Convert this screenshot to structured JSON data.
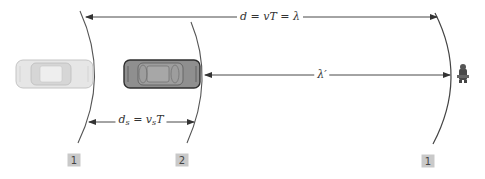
{
  "figure": {
    "labels": {
      "top_distance": "d = vT = λ",
      "wavelength_observed": "λ′",
      "source_distance_prefix": "d",
      "source_distance_sub": "s",
      "source_distance_eq": " = v",
      "source_distance_sub2": "s",
      "source_distance_suffix": "T"
    },
    "wavefronts": [
      {
        "id": "wavefront-1-left",
        "marker": "1"
      },
      {
        "id": "wavefront-2",
        "marker": "2"
      },
      {
        "id": "wavefront-1-right",
        "marker": "1"
      }
    ],
    "objects": {
      "source_position_1": "car (earlier position, faded)",
      "source_position_2": "car (current position)",
      "observer": "observer"
    },
    "colors": {
      "line": "#555555",
      "car_light": "#e2e2e2",
      "car_dark": "#8f8f8f",
      "marker_box": "#c9c9c9"
    }
  }
}
